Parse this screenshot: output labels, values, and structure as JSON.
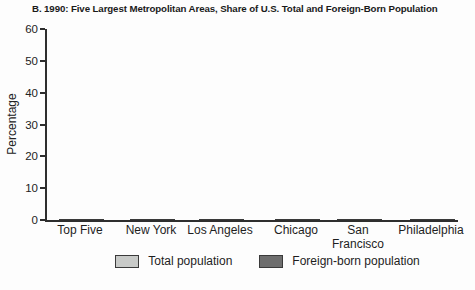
{
  "chart": {
    "title": "B. 1990: Five Largest Metropolitan Areas, Share of U.S. Total and Foreign-Born Population",
    "ylabel": "Percentage"
  },
  "chart_data": {
    "type": "bar",
    "title": "B. 1990: Five Largest Metropolitan Areas, Share of U.S. Total and Foreign-Born Population",
    "xlabel": "",
    "ylabel": "Percentage",
    "categories": [
      "Top Five",
      "New York",
      "Los Angeles",
      "Chicago",
      "San Francisco",
      "Philadelphia"
    ],
    "series": [
      {
        "name": "Total population",
        "color": "#c8cac8",
        "values": [
          21,
          7,
          6,
          3,
          3,
          2
        ]
      },
      {
        "name": "Foreign-born population",
        "color": "#6e6e6e",
        "values": [
          51,
          18,
          20,
          5,
          6,
          2
        ]
      }
    ],
    "ylim": [
      0,
      60
    ],
    "yticks": [
      0,
      10,
      20,
      30,
      40,
      50,
      60
    ],
    "grid": false,
    "legend_position": "bottom",
    "bar_outline_color": "#3a3a3a",
    "axis_color": "#2e2e2e"
  }
}
